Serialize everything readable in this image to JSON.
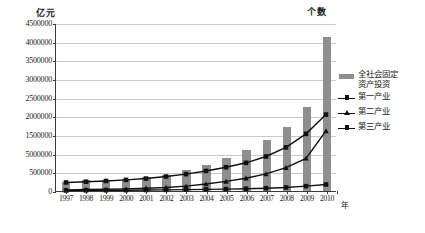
{
  "axes": {
    "left_unit": "亿元",
    "right_unit": "个数",
    "x_caption": "年"
  },
  "legend": {
    "items": [
      {
        "label": "全社会固定\n资产投资",
        "marker": "bar-swatch",
        "color": "#8e8e8e"
      },
      {
        "label": "第一产业",
        "marker": "line-square",
        "color": "#111111"
      },
      {
        "label": "第二产业",
        "marker": "line-triangle",
        "color": "#111111"
      },
      {
        "label": "第三产业",
        "marker": "line-square",
        "color": "#111111"
      }
    ]
  },
  "chart_data": {
    "type": "bar",
    "title": "",
    "subtitle": "",
    "xlabel": "年",
    "ylabel": "亿元",
    "y2label": "个数",
    "grid": true,
    "legend_position": "right",
    "ylim": [
      0,
      4500000
    ],
    "ytick_labels": [
      "4500000",
      "4000000",
      "3500000",
      "3000000",
      "2500000",
      "2000000",
      "1500000",
      "5000000",
      "500000",
      "0"
    ],
    "ytick_values": [
      4500000,
      4000000,
      3500000,
      3000000,
      2500000,
      2000000,
      1500000,
      1000000,
      500000,
      0
    ],
    "categories": [
      "1997",
      "1998",
      "1999",
      "2000",
      "2001",
      "2002",
      "2003",
      "2004",
      "2005",
      "2006",
      "2007",
      "2008",
      "2009",
      "2010"
    ],
    "series": [
      {
        "name": "全社会固定资产投资",
        "type": "bar",
        "color": "#8e8e8e",
        "values": [
          245000,
          285000,
          300000,
          330000,
          375000,
          440000,
          555000,
          705000,
          890000,
          1100000,
          1375000,
          1720000,
          2245000,
          4125000
        ]
      },
      {
        "name": "第一产业",
        "type": "line",
        "marker": "square",
        "color": "#111111",
        "values": [
          15000,
          18000,
          20000,
          22000,
          26000,
          30000,
          36000,
          43000,
          52000,
          62000,
          75000,
          95000,
          130000,
          175000
        ]
      },
      {
        "name": "第二产业",
        "type": "line",
        "marker": "triangle",
        "color": "#111111",
        "values": [
          30000,
          40000,
          48000,
          58000,
          75000,
          95000,
          130000,
          190000,
          260000,
          345000,
          460000,
          630000,
          880000,
          1620000
        ]
      },
      {
        "name": "第三产业",
        "type": "line",
        "marker": "square",
        "color": "#111111",
        "values": [
          230000,
          250000,
          270000,
          300000,
          335000,
          390000,
          455000,
          540000,
          640000,
          760000,
          930000,
          1175000,
          1540000,
          2060000
        ]
      }
    ]
  }
}
